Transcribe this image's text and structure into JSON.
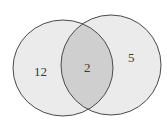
{
  "diagram": {
    "type": "venn",
    "sets": [
      {
        "name": "A",
        "only_count": "12"
      },
      {
        "name": "B",
        "only_count": "5"
      }
    ],
    "intersection": {
      "count": "2"
    },
    "colors": {
      "circle_fill": "#ebebeb",
      "intersection_fill": "#cfcfcf",
      "stroke": "#4a4a4a",
      "background": "#ffffff"
    }
  }
}
